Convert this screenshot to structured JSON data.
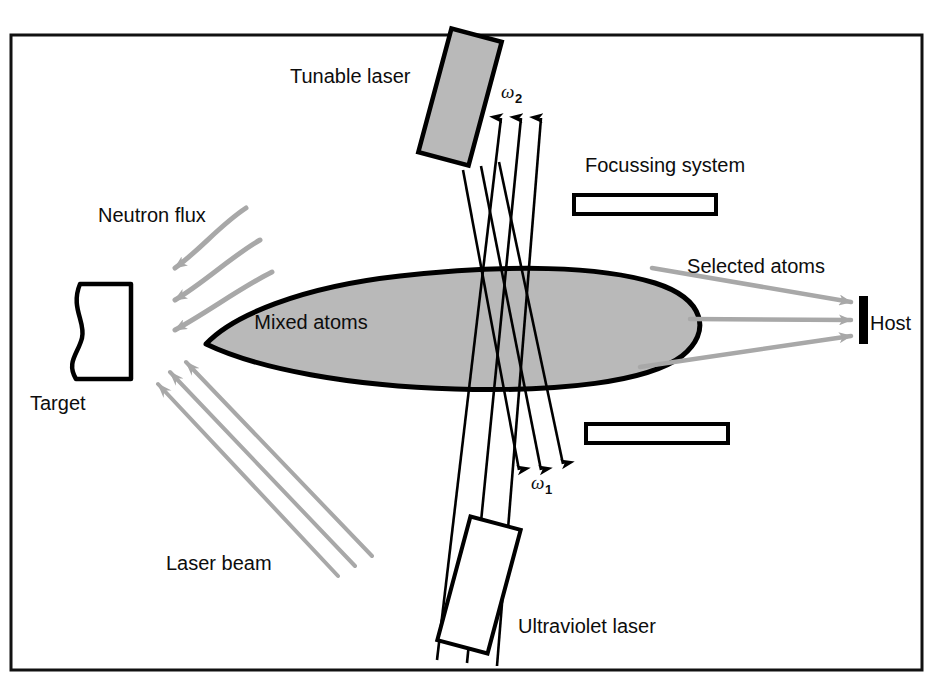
{
  "figure": {
    "border_color": "#111111",
    "plume_fill": "#b9b9b9",
    "plume_stroke": "#000000",
    "beam_color": "#000000",
    "flux_color": "#a8a8a8",
    "laser_tunable_fill": "#b9b9b9",
    "laser_uv_fill": "#ffffff"
  },
  "labels": {
    "tunable_laser": "Tunable laser",
    "ultraviolet_laser": "Ultraviolet laser",
    "focussing_system": "Focussing system",
    "neutron_flux": "Neutron flux",
    "laser_beam": "Laser beam",
    "target": "Target",
    "mixed_atoms": "Mixed atoms",
    "selected_atoms": "Selected atoms",
    "host": "Host",
    "omega2": "ω",
    "omega2_sub": "2",
    "omega1": "ω",
    "omega1_sub": "1"
  },
  "components": [
    {
      "name": "target-block",
      "label": "Target"
    },
    {
      "name": "tunable-laser-block",
      "label": "Tunable laser"
    },
    {
      "name": "ultraviolet-laser-block",
      "label": "Ultraviolet laser"
    },
    {
      "name": "focussing-plate-top",
      "label": "Focussing system"
    },
    {
      "name": "focussing-plate-bottom",
      "label": "Focussing system"
    },
    {
      "name": "host-collector",
      "label": "Host"
    },
    {
      "name": "atom-plume",
      "label": "Mixed atoms"
    }
  ],
  "beams": {
    "omega2_count": 3,
    "omega1_count": 3,
    "neutron_flux_count": 3,
    "laser_beam_count": 3,
    "selected_atoms_count": 3
  }
}
